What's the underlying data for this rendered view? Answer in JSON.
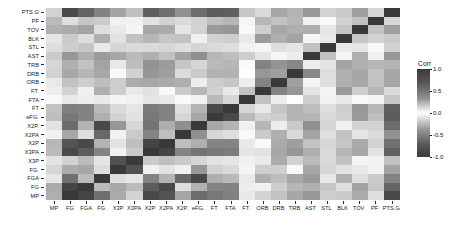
{
  "chart_data": {
    "type": "heatmap",
    "title": "",
    "xlabel": "",
    "ylabel": "",
    "legend": {
      "title": "Corr",
      "ticks": [
        "1.0",
        "0.5",
        "0.0",
        "-0.5",
        "-1.0"
      ],
      "tick_values": [
        1.0,
        0.5,
        0.0,
        -0.5,
        -1.0
      ],
      "position": "right",
      "colormap": "diverging-grayscale",
      "low_color": "#3c3c3c",
      "mid_color": "#fdfdfd",
      "high_color": "#3a3a3a"
    },
    "zlim": [
      -1.0,
      1.0
    ],
    "grid": false,
    "x_categories": [
      "MP",
      "FG",
      "FGA",
      "FG.",
      "X3P",
      "X3PA",
      "X2P",
      "X2PA",
      "X2P.",
      "eFG.",
      "FT",
      "FTA",
      "FT.",
      "ORB",
      "DRB",
      "TRB",
      "AST",
      "STL",
      "BLK",
      "TOV",
      "PF",
      "PTS.G"
    ],
    "y_categories": [
      "PTS.G",
      "PF",
      "TOV",
      "BLK",
      "STL",
      "AST",
      "TRB",
      "DRB",
      "ORB",
      "FT.",
      "FTA",
      "FT",
      "eFG.",
      "X2P.",
      "X2PA",
      "X2P",
      "X3PA",
      "X3P",
      "FG.",
      "FGA",
      "FG",
      "MP"
    ],
    "values": [
      [
        0.22,
        0.92,
        0.78,
        0.62,
        0.46,
        0.31,
        0.8,
        0.72,
        0.55,
        0.74,
        0.82,
        0.8,
        0.28,
        0.18,
        0.44,
        0.38,
        0.52,
        0.22,
        0.26,
        0.48,
        0.2,
        1.0
      ],
      [
        0.34,
        0.16,
        0.28,
        -0.26,
        -0.06,
        0.06,
        0.14,
        0.22,
        -0.18,
        -0.22,
        0.32,
        0.36,
        -0.04,
        0.36,
        0.3,
        0.36,
        0.06,
        0.02,
        0.22,
        0.3,
        1.0,
        0.2
      ],
      [
        0.4,
        0.42,
        0.46,
        0.16,
        0.1,
        0.04,
        0.44,
        0.42,
        0.12,
        0.22,
        0.5,
        0.52,
        0.02,
        0.24,
        0.44,
        0.4,
        0.4,
        0.12,
        0.28,
        1.0,
        0.3,
        0.48
      ],
      [
        0.12,
        0.26,
        0.16,
        0.4,
        -0.14,
        -0.3,
        0.36,
        0.28,
        -0.3,
        0.06,
        0.22,
        0.24,
        -0.1,
        0.5,
        0.4,
        0.46,
        0.04,
        0.1,
        1.0,
        0.28,
        0.22,
        0.26
      ],
      [
        0.16,
        0.24,
        0.28,
        0.1,
        0.2,
        0.18,
        0.18,
        0.2,
        0.16,
        0.2,
        0.18,
        0.16,
        0.06,
        0.04,
        0.16,
        0.12,
        0.3,
        1.0,
        0.1,
        0.12,
        0.02,
        0.22
      ],
      [
        0.26,
        0.52,
        0.4,
        0.5,
        0.44,
        0.34,
        0.4,
        0.3,
        0.46,
        0.56,
        0.36,
        0.32,
        0.24,
        -0.12,
        -0.04,
        -0.08,
        1.0,
        0.3,
        0.04,
        0.4,
        0.06,
        0.52
      ],
      [
        0.2,
        0.4,
        0.3,
        0.46,
        -0.1,
        -0.32,
        0.54,
        0.5,
        -0.28,
        0.2,
        0.34,
        0.36,
        -0.02,
        0.62,
        0.54,
        0.6,
        -0.08,
        0.12,
        0.46,
        0.4,
        0.36,
        0.38
      ],
      [
        0.22,
        0.44,
        0.36,
        0.44,
        -0.02,
        -0.22,
        0.52,
        0.48,
        -0.18,
        0.26,
        0.38,
        0.38,
        0.0,
        0.52,
        0.48,
        1.0,
        0.6,
        0.16,
        0.4,
        0.44,
        0.3,
        0.44
      ],
      [
        0.1,
        0.3,
        0.24,
        0.32,
        -0.24,
        -0.42,
        0.44,
        0.42,
        -0.4,
        0.08,
        0.24,
        0.28,
        -0.08,
        0.62,
        1.0,
        0.48,
        -0.04,
        0.16,
        0.4,
        0.44,
        0.3,
        0.44
      ],
      [
        0.08,
        0.22,
        0.06,
        0.4,
        0.24,
        0.1,
        0.14,
        0.02,
        0.26,
        0.36,
        0.22,
        0.1,
        0.3,
        1.0,
        0.62,
        0.52,
        -0.12,
        0.04,
        0.5,
        0.24,
        0.36,
        0.18
      ],
      [
        0.02,
        0.1,
        0.08,
        0.1,
        -0.04,
        -0.06,
        0.12,
        0.1,
        -0.02,
        0.06,
        0.34,
        0.2,
        1.0,
        0.3,
        -0.08,
        0.0,
        0.24,
        0.06,
        -0.1,
        0.02,
        -0.04,
        0.28
      ],
      [
        0.3,
        0.64,
        0.62,
        0.34,
        0.18,
        0.12,
        0.66,
        0.62,
        0.16,
        0.38,
        0.92,
        1.0,
        0.2,
        0.1,
        0.28,
        0.38,
        0.32,
        0.16,
        0.24,
        0.52,
        0.36,
        0.8
      ],
      [
        0.32,
        0.68,
        0.62,
        0.4,
        0.22,
        0.14,
        0.68,
        0.62,
        0.2,
        0.44,
        1.0,
        0.92,
        0.34,
        0.22,
        0.24,
        0.38,
        0.36,
        0.18,
        0.22,
        0.5,
        0.32,
        0.82
      ],
      [
        0.14,
        0.74,
        0.38,
        0.92,
        0.52,
        0.2,
        0.7,
        0.4,
        0.56,
        1.0,
        0.44,
        0.38,
        0.06,
        0.36,
        0.08,
        0.26,
        0.56,
        0.2,
        0.06,
        0.22,
        -0.22,
        0.74
      ],
      [
        0.06,
        0.44,
        0.16,
        0.76,
        0.06,
        -0.26,
        0.62,
        0.32,
        1.0,
        0.56,
        0.2,
        0.16,
        -0.02,
        0.26,
        -0.4,
        -0.18,
        0.46,
        0.16,
        -0.3,
        0.12,
        -0.18,
        0.55
      ],
      [
        0.36,
        0.86,
        0.92,
        0.38,
        -0.14,
        -0.32,
        0.94,
        1.0,
        0.32,
        0.4,
        0.62,
        0.62,
        0.1,
        0.02,
        0.42,
        0.48,
        0.3,
        0.2,
        0.28,
        0.42,
        0.22,
        0.72
      ],
      [
        0.34,
        0.92,
        0.82,
        0.62,
        -0.06,
        -0.26,
        1.0,
        0.94,
        0.62,
        0.7,
        0.68,
        0.66,
        0.12,
        0.14,
        0.44,
        0.52,
        0.4,
        0.18,
        0.36,
        0.44,
        0.14,
        0.8
      ],
      [
        0.14,
        0.22,
        0.34,
        -0.12,
        0.88,
        1.0,
        -0.26,
        -0.32,
        -0.26,
        0.2,
        0.14,
        0.12,
        -0.06,
        0.1,
        -0.42,
        -0.22,
        0.34,
        0.18,
        -0.3,
        0.04,
        0.06,
        0.31
      ],
      [
        0.2,
        0.42,
        0.44,
        0.16,
        1.0,
        0.88,
        -0.06,
        -0.14,
        0.06,
        0.52,
        0.22,
        0.18,
        -0.04,
        0.24,
        -0.24,
        -0.02,
        0.44,
        0.2,
        -0.14,
        0.1,
        -0.06,
        0.46
      ],
      [
        0.12,
        0.72,
        0.34,
        1.0,
        0.16,
        -0.12,
        0.62,
        0.38,
        0.76,
        0.92,
        0.4,
        0.34,
        0.1,
        0.4,
        0.32,
        0.44,
        0.5,
        0.1,
        0.4,
        0.16,
        -0.26,
        0.62
      ],
      [
        0.42,
        0.94,
        1.0,
        0.34,
        0.44,
        0.34,
        0.82,
        0.92,
        0.16,
        0.38,
        0.62,
        0.62,
        0.08,
        0.06,
        0.24,
        0.36,
        0.4,
        0.28,
        0.16,
        0.46,
        0.28,
        0.78
      ],
      [
        0.4,
        1.0,
        0.94,
        0.72,
        0.42,
        0.22,
        0.92,
        0.86,
        0.44,
        0.74,
        0.68,
        0.64,
        0.1,
        0.22,
        0.3,
        0.44,
        0.52,
        0.24,
        0.26,
        0.42,
        0.16,
        0.92
      ]
    ]
  }
}
